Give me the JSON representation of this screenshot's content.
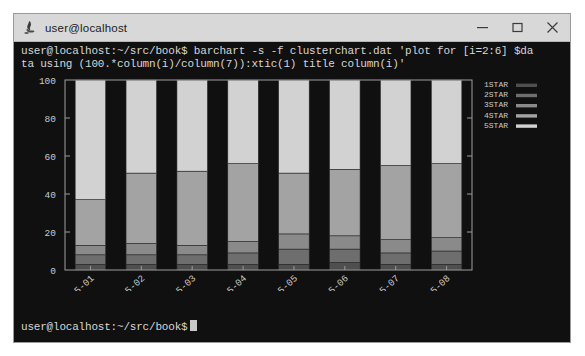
{
  "window": {
    "title": "user@localhost",
    "app_icon": "gnome-terminal-icon",
    "controls": [
      {
        "name": "minimize-button",
        "glyph": "minimize-icon"
      },
      {
        "name": "maximize-button",
        "glyph": "maximize-icon"
      },
      {
        "name": "close-button",
        "glyph": "close-icon"
      }
    ]
  },
  "terminal": {
    "command_line_1": "user@localhost:~/src/book$ barchart -s -f clusterchart.dat 'plot for [i=2:6] $da",
    "command_line_2": "ta using (100.*column(i)/column(7)):xtic(1) title column(i)'",
    "prompt": "user@localhost:~/src/book$",
    "cursor": "block-cursor",
    "foreground": "#d6d6d6",
    "background": "#101010"
  },
  "chart_data": {
    "type": "bar",
    "title": "",
    "xlabel": "",
    "ylabel": "",
    "stacked": true,
    "grid": false,
    "legend_position": "top-right",
    "ylim": [
      0,
      100
    ],
    "yticks": [
      0,
      20,
      40,
      60,
      80,
      100
    ],
    "categories": [
      "2015-01",
      "2015-02",
      "2015-03",
      "2015-04",
      "2015-05",
      "2015-06",
      "2015-07",
      "2015-08"
    ],
    "series": [
      {
        "name": "1STAR",
        "color": "#4f4f4f",
        "values": [
          3,
          3,
          3,
          3,
          3,
          4,
          3,
          3
        ]
      },
      {
        "name": "2STAR",
        "color": "#6e6e6e",
        "values": [
          5,
          5,
          5,
          6,
          8,
          7,
          6,
          7
        ]
      },
      {
        "name": "3STAR",
        "color": "#8a8a8a",
        "values": [
          5,
          6,
          5,
          6,
          8,
          7,
          7,
          7
        ]
      },
      {
        "name": "4STAR",
        "color": "#a3a3a3",
        "values": [
          24,
          37,
          39,
          41,
          32,
          35,
          39,
          39
        ]
      },
      {
        "name": "5STAR",
        "color": "#d2d2d2",
        "values": [
          63,
          49,
          48,
          44,
          49,
          47,
          45,
          44
        ]
      }
    ]
  }
}
